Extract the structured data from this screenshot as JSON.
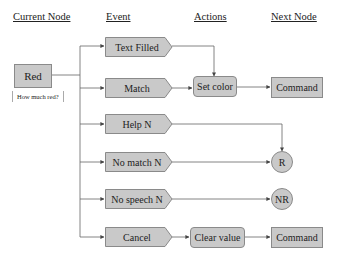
{
  "headers": {
    "current_node": "Current Node",
    "event": "Event",
    "actions": "Actions",
    "next_node": "Next Node"
  },
  "current_node": {
    "label": "Red",
    "prompt": "How much red?"
  },
  "events": [
    {
      "label": "Text Filled"
    },
    {
      "label": "Match"
    },
    {
      "label": "Help N"
    },
    {
      "label": "No match N"
    },
    {
      "label": "No speech N"
    },
    {
      "label": "Cancel"
    }
  ],
  "actions": {
    "set_color": "Set color",
    "clear_value": "Clear value"
  },
  "next_nodes": {
    "command_1": "Command",
    "r": "R",
    "nr": "NR",
    "command_2": "Command"
  },
  "colors": {
    "node_fill": "#c9c9c9",
    "node_border": "#8a8a8a",
    "line": "#666666"
  }
}
